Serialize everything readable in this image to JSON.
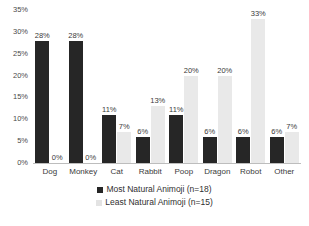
{
  "chart_data": {
    "type": "bar",
    "title": "",
    "subtitle": "",
    "xlabel": "",
    "ylabel": "",
    "ylim": [
      0,
      35
    ],
    "ytick_labels": [
      "35%",
      "30%",
      "25%",
      "20%",
      "15%",
      "10%",
      "5%",
      "0%"
    ],
    "ytick_values": [
      35,
      30,
      25,
      20,
      15,
      10,
      5,
      0
    ],
    "grid": false,
    "legend_position": "bottom",
    "categories": [
      "Dog",
      "Monkey",
      "Cat",
      "Rabbit",
      "Poop",
      "Dragon",
      "Robot",
      "Other"
    ],
    "series": [
      {
        "name": "Most Natural Animoji (n=18)",
        "color": "#262626",
        "values": [
          28,
          28,
          11,
          6,
          11,
          6,
          6,
          6
        ],
        "labels": [
          "28%",
          "28%",
          "11%",
          "6%",
          "11%",
          "6%",
          "6%",
          "6%"
        ]
      },
      {
        "name": "Least Natural Animoji (n=15)",
        "color": "#e9e9e9",
        "values": [
          0,
          0,
          7,
          13,
          20,
          20,
          33,
          7
        ],
        "labels": [
          "0%",
          "0%",
          "7%",
          "13%",
          "20%",
          "20%",
          "33%",
          "7%"
        ]
      }
    ]
  },
  "legend": {
    "items": [
      {
        "label": "Most Natural Animoji (n=18)"
      },
      {
        "label": "Least Natural Animoji (n=15)"
      }
    ]
  }
}
